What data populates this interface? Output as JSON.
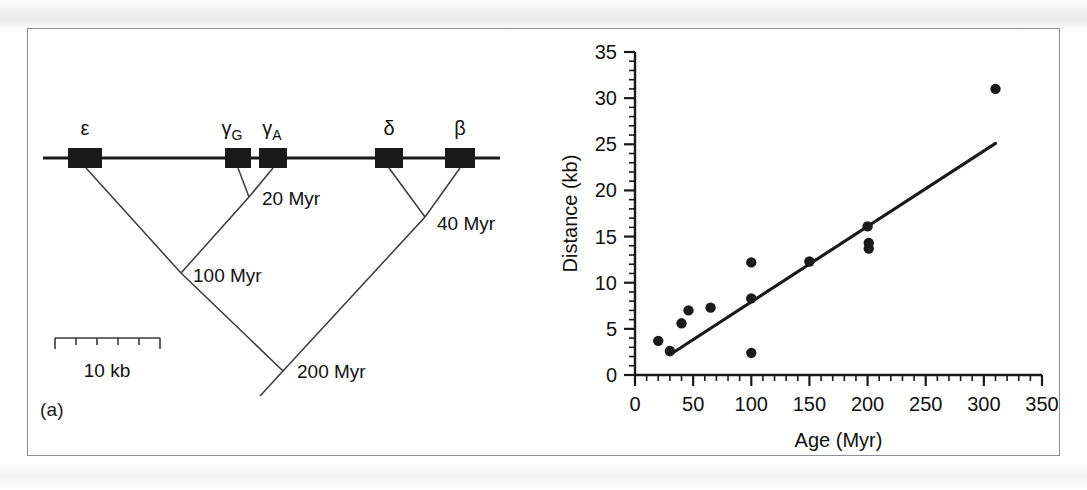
{
  "figure": {
    "panel_a_label": "(a)",
    "panel_b_label": "(b)"
  },
  "panel_a": {
    "title": "beta-globin gene cluster with phylogenetic tree",
    "genes": [
      {
        "name": "epsilon",
        "label": "ε",
        "sub": "",
        "x": 85,
        "width": 34
      },
      {
        "name": "gamma-G",
        "label": "γ",
        "sub": "G",
        "x": 228,
        "width": 26
      },
      {
        "name": "gamma-A",
        "label": "γ",
        "sub": "A",
        "x": 268,
        "width": 28
      },
      {
        "name": "delta",
        "label": "δ",
        "sub": "",
        "x": 381,
        "width": 28
      },
      {
        "name": "beta",
        "label": "β",
        "sub": "",
        "x": 452,
        "width": 30
      }
    ],
    "divergence_labels": [
      {
        "name": "gamma-split",
        "text": "20 Myr"
      },
      {
        "name": "delta-beta-split",
        "text": "40 Myr"
      },
      {
        "name": "epsilon-gamma-split",
        "text": "100 Myr"
      },
      {
        "name": "root-split",
        "text": "200 Myr"
      }
    ],
    "scale_bar": {
      "label": "10 kb",
      "segments": 5
    }
  },
  "panel_b": {
    "caption": "Distance versus age scatter with regression line"
  },
  "chart_data": {
    "type": "scatter",
    "title": "",
    "xlabel": "Age (Myr)",
    "ylabel": "Distance (kb)",
    "xlim": [
      0,
      350
    ],
    "ylim": [
      0,
      35
    ],
    "xticks": [
      0,
      50,
      100,
      150,
      200,
      250,
      300,
      350
    ],
    "xtick_labels": [
      "0",
      "50",
      "100",
      "150",
      "200",
      "250",
      "300",
      "350"
    ],
    "x_minor_step": 10,
    "yticks": [
      0,
      5,
      10,
      15,
      20,
      25,
      30,
      35
    ],
    "ytick_labels": [
      "0",
      "5",
      "10",
      "15",
      "20",
      "25",
      "30",
      "35"
    ],
    "y_minor_step": 1,
    "grid": false,
    "legend": false,
    "marker": "filled-circle",
    "marker_color": "#1a1a1a",
    "points": [
      {
        "x": 20,
        "y": 3.7
      },
      {
        "x": 30,
        "y": 2.6
      },
      {
        "x": 40,
        "y": 5.6
      },
      {
        "x": 46,
        "y": 7.0
      },
      {
        "x": 65,
        "y": 7.3
      },
      {
        "x": 100,
        "y": 12.2
      },
      {
        "x": 100,
        "y": 8.3
      },
      {
        "x": 100,
        "y": 2.4
      },
      {
        "x": 150,
        "y": 12.3
      },
      {
        "x": 200,
        "y": 16.1
      },
      {
        "x": 201,
        "y": 14.3
      },
      {
        "x": 201,
        "y": 13.7
      },
      {
        "x": 310,
        "y": 31.0
      }
    ],
    "fit_line": {
      "name": "regression-line",
      "x0": 30,
      "y0": 2.2,
      "x1": 310,
      "y1": 25.1,
      "color": "#1a1a1a"
    }
  }
}
